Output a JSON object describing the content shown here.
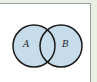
{
  "diagram": {
    "type": "venn",
    "sets": [
      {
        "label": "A",
        "cx": 34,
        "cy": 46,
        "r": 21
      },
      {
        "label": "B",
        "cx": 61,
        "cy": 46,
        "r": 21
      }
    ],
    "colors": {
      "fill": "#c6dcea",
      "stroke": "#1a1a1a",
      "background": "#ffffff",
      "outer": "#e9efe2",
      "frame": "#9a9e98"
    }
  }
}
